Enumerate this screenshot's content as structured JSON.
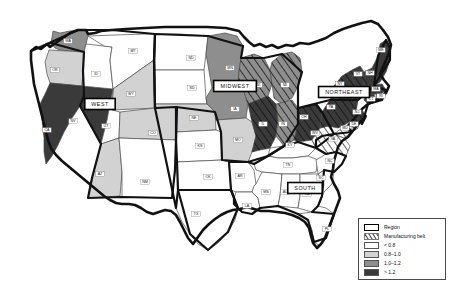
{
  "figure": {
    "type": "choropleth-map",
    "background_color": "#ffffff"
  },
  "legend": {
    "title": "",
    "position": "bottom-right",
    "border_color": "#4a4a4a",
    "items": [
      {
        "id": "region",
        "label": "Region",
        "swatch": "thick-black-outline-white",
        "color": "#ffffff",
        "border": "#000000"
      },
      {
        "id": "manufacturing-belt",
        "label": "Manufacturing belt",
        "swatch": "diagonal-hatch",
        "color": "#ffffff",
        "hatch_color": "#3a3a3a"
      },
      {
        "id": "class1",
        "label": "< 0.8",
        "swatch": "fill",
        "color": "#ffffff"
      },
      {
        "id": "class2",
        "label": "0.8–1.0",
        "swatch": "fill",
        "color": "#d2d2d2"
      },
      {
        "id": "class3",
        "label": "1.0–1.2",
        "swatch": "fill",
        "color": "#8e8e8e"
      },
      {
        "id": "class4",
        "label": "> 1.2",
        "swatch": "fill",
        "color": "#3a3a3a"
      }
    ]
  },
  "regions": [
    {
      "id": "west",
      "label": "WEST",
      "x": 100,
      "y": 104
    },
    {
      "id": "midwest",
      "label": "MIDWEST",
      "x": 235,
      "y": 86
    },
    {
      "id": "northeast",
      "label": "NORTHEAST",
      "x": 344,
      "y": 92
    },
    {
      "id": "south",
      "label": "SOUTH",
      "x": 305,
      "y": 188
    }
  ],
  "chart_data": {
    "type": "heatmap",
    "title": "",
    "value_classes": [
      "< 0.8",
      "0.8–1.0",
      "1.0–1.2",
      "> 1.2"
    ],
    "class_colors": [
      "#ffffff",
      "#d2d2d2",
      "#8e8e8e",
      "#3a3a3a"
    ],
    "states": [
      {
        "code": "WA",
        "class": 3,
        "belt": false,
        "x": 68,
        "y": 41
      },
      {
        "code": "OR",
        "class": 2,
        "belt": false,
        "x": 55,
        "y": 70
      },
      {
        "code": "CA",
        "class": 4,
        "belt": false,
        "x": 47,
        "y": 130
      },
      {
        "code": "NV",
        "class": 4,
        "belt": false,
        "x": 73,
        "y": 121
      },
      {
        "code": "ID",
        "class": 1,
        "belt": false,
        "x": 96,
        "y": 74
      },
      {
        "code": "MT",
        "class": 1,
        "belt": false,
        "x": 133,
        "y": 51
      },
      {
        "code": "WY",
        "class": 2,
        "belt": false,
        "x": 131,
        "y": 94
      },
      {
        "code": "UT",
        "class": 1,
        "belt": false,
        "x": 106,
        "y": 126
      },
      {
        "code": "AZ",
        "class": 2,
        "belt": false,
        "x": 100,
        "y": 174
      },
      {
        "code": "CO",
        "class": 2,
        "belt": false,
        "x": 153,
        "y": 133
      },
      {
        "code": "NM",
        "class": 1,
        "belt": false,
        "x": 145,
        "y": 182
      },
      {
        "code": "ND",
        "class": 1,
        "belt": false,
        "x": 191,
        "y": 58
      },
      {
        "code": "SD",
        "class": 1,
        "belt": false,
        "x": 192,
        "y": 88
      },
      {
        "code": "NE",
        "class": 2,
        "belt": false,
        "x": 194,
        "y": 118
      },
      {
        "code": "KS",
        "class": 1,
        "belt": false,
        "x": 200,
        "y": 146
      },
      {
        "code": "OK",
        "class": 1,
        "belt": false,
        "x": 208,
        "y": 177
      },
      {
        "code": "TX",
        "class": 1,
        "belt": false,
        "x": 196,
        "y": 214
      },
      {
        "code": "MN",
        "class": 3,
        "belt": false,
        "x": 230,
        "y": 68
      },
      {
        "code": "IA",
        "class": 3,
        "belt": false,
        "x": 235,
        "y": 109
      },
      {
        "code": "MO",
        "class": 2,
        "belt": false,
        "x": 238,
        "y": 140
      },
      {
        "code": "AR",
        "class": 1,
        "belt": false,
        "x": 240,
        "y": 176
      },
      {
        "code": "LA",
        "class": 1,
        "belt": false,
        "x": 247,
        "y": 206
      },
      {
        "code": "WI",
        "class": 3,
        "belt": true,
        "x": 258,
        "y": 85
      },
      {
        "code": "MI",
        "class": 3,
        "belt": true,
        "x": 285,
        "y": 85
      },
      {
        "code": "IL",
        "class": 4,
        "belt": true,
        "x": 263,
        "y": 124
      },
      {
        "code": "IN",
        "class": 3,
        "belt": true,
        "x": 283,
        "y": 124
      },
      {
        "code": "OH",
        "class": 4,
        "belt": true,
        "x": 304,
        "y": 117
      },
      {
        "code": "KY",
        "class": 1,
        "belt": false,
        "x": 290,
        "y": 145
      },
      {
        "code": "TN",
        "class": 1,
        "belt": false,
        "x": 288,
        "y": 165
      },
      {
        "code": "MS",
        "class": 1,
        "belt": false,
        "x": 266,
        "y": 192
      },
      {
        "code": "AL",
        "class": 1,
        "belt": false,
        "x": 285,
        "y": 192
      },
      {
        "code": "GA",
        "class": 1,
        "belt": false,
        "x": 307,
        "y": 194
      },
      {
        "code": "FL",
        "class": 1,
        "belt": false,
        "x": 327,
        "y": 229
      },
      {
        "code": "SC",
        "class": 1,
        "belt": false,
        "x": 321,
        "y": 178
      },
      {
        "code": "NC",
        "class": 1,
        "belt": false,
        "x": 330,
        "y": 161
      },
      {
        "code": "VA",
        "class": 1,
        "belt": true,
        "x": 333,
        "y": 139
      },
      {
        "code": "WV",
        "class": 1,
        "belt": true,
        "x": 315,
        "y": 133
      },
      {
        "code": "MD",
        "class": 1,
        "belt": true,
        "x": 345,
        "y": 128
      },
      {
        "code": "DE",
        "class": 1,
        "belt": true,
        "x": 354,
        "y": 124
      },
      {
        "code": "PA",
        "class": 4,
        "belt": true,
        "x": 331,
        "y": 107
      },
      {
        "code": "NJ",
        "class": 4,
        "belt": true,
        "x": 357,
        "y": 112
      },
      {
        "code": "NY",
        "class": 4,
        "belt": true,
        "x": 340,
        "y": 84
      },
      {
        "code": "CT",
        "class": 4,
        "belt": false,
        "x": 371,
        "y": 99
      },
      {
        "code": "RI",
        "class": 4,
        "belt": false,
        "x": 381,
        "y": 96
      },
      {
        "code": "MA",
        "class": 4,
        "belt": false,
        "x": 376,
        "y": 89
      },
      {
        "code": "VT",
        "class": 4,
        "belt": false,
        "x": 358,
        "y": 74
      },
      {
        "code": "NH",
        "class": 4,
        "belt": false,
        "x": 370,
        "y": 73
      },
      {
        "code": "ME",
        "class": 4,
        "belt": false,
        "x": 381,
        "y": 50
      }
    ]
  }
}
